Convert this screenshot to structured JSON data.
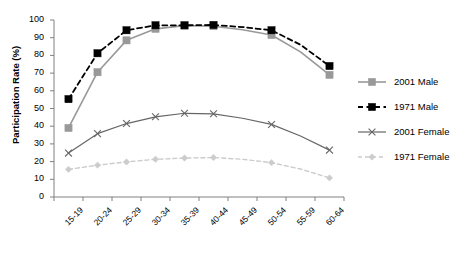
{
  "chart_data": {
    "type": "line",
    "title": "",
    "xlabel": "",
    "ylabel": "Participation Rate (%)",
    "ylim": [
      0,
      100
    ],
    "yticks": [
      0,
      10,
      20,
      30,
      40,
      50,
      60,
      70,
      80,
      90,
      100
    ],
    "grid": false,
    "legend_position": "right",
    "categories": [
      "15-19",
      "20-24",
      "25-29",
      "30-34",
      "35-39",
      "40-44",
      "45-49",
      "50-54",
      "55-59",
      "60-64"
    ],
    "series": [
      {
        "name": "2001 Male",
        "color": "#999999",
        "line_style": "solid",
        "marker": "square",
        "marker_color": "#999999",
        "marker_categories": [
          "15-19",
          "20-24",
          "25-29",
          "30-34",
          "35-39",
          "40-44",
          "50-54",
          "60-64"
        ],
        "values": [
          39,
          70.5,
          88.5,
          95,
          96.8,
          96.5,
          94.5,
          91.5,
          82,
          69
        ]
      },
      {
        "name": "1971 Male",
        "color": "#000000",
        "line_style": "dashed",
        "marker": "square",
        "marker_color": "#000000",
        "marker_categories": [
          "15-19",
          "20-24",
          "25-29",
          "30-34",
          "35-39",
          "40-44",
          "50-54",
          "60-64"
        ],
        "values": [
          55.3,
          81.2,
          94.2,
          97,
          97,
          97.2,
          96,
          94.2,
          86,
          74
        ]
      },
      {
        "name": "2001 Female",
        "color": "#666666",
        "line_style": "solid",
        "marker": "x",
        "marker_color": "#666666",
        "marker_categories": [
          "15-19",
          "20-24",
          "25-29",
          "30-34",
          "35-39",
          "40-44",
          "50-54",
          "60-64"
        ],
        "values": [
          24.8,
          35.8,
          41.5,
          45.3,
          47.3,
          47,
          44.5,
          41,
          34.5,
          26.5
        ]
      },
      {
        "name": "1971 Female",
        "color": "#cccccc",
        "line_style": "dashed",
        "marker": "diamond",
        "marker_color": "#cccccc",
        "marker_categories": [
          "15-19",
          "20-24",
          "25-29",
          "30-34",
          "35-39",
          "40-44",
          "50-54",
          "60-64"
        ],
        "values": [
          15.6,
          18,
          19.8,
          21.3,
          22,
          22.3,
          21.3,
          19.4,
          15.8,
          10.8
        ]
      }
    ]
  },
  "legend": {
    "items": [
      {
        "label": "2001 Male"
      },
      {
        "label": "1971 Male"
      },
      {
        "label": "2001 Female"
      },
      {
        "label": "1971 Female"
      }
    ]
  },
  "axes": {
    "y_title": "Participation Rate (%)",
    "y_tick_labels": [
      "100",
      "90",
      "80",
      "70",
      "60",
      "50",
      "40",
      "30",
      "20",
      "10",
      "0"
    ],
    "x_tick_labels": [
      "15-19",
      "20-24",
      "25-29",
      "30-34",
      "35-39",
      "40-44",
      "45-49",
      "50-54",
      "55-59",
      "60-64"
    ]
  },
  "colors": {
    "series_2001_male": "#999999",
    "series_1971_male": "#000000",
    "series_2001_female": "#666666",
    "series_1971_female": "#cccccc",
    "axis": "#808080",
    "text": "#000000",
    "background": "#ffffff"
  }
}
